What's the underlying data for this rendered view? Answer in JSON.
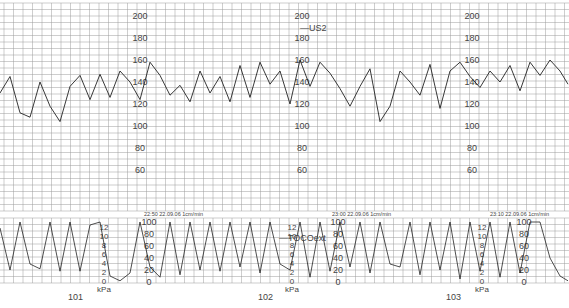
{
  "chart_data": {
    "type": "line",
    "panels": [
      {
        "name": "fetal_heart_rate",
        "channel_label": "US2",
        "ylabel": "bpm",
        "ylim": [
          50,
          210
        ],
        "yticks": [
          60,
          80,
          100,
          120,
          140,
          160,
          180,
          200
        ],
        "grid": true,
        "series": [
          {
            "name": "US2",
            "x": [
              0,
              10,
              20,
              30,
              40,
              50,
              60,
              70,
              80,
              90,
              100,
              110,
              120,
              130,
              140,
              150,
              160,
              170,
              180,
              190,
              200,
              210,
              220,
              230,
              240,
              250,
              260,
              270,
              280,
              290,
              300,
              310,
              320,
              330,
              340,
              350,
              360,
              370,
              380,
              390,
              400,
              410,
              420,
              430,
              440,
              450,
              460,
              470,
              480,
              490,
              500,
              510,
              520,
              530,
              540,
              550,
              560,
              568
            ],
            "y": [
              130,
              145,
              112,
              108,
              140,
              118,
              104,
              136,
              146,
              124,
              147,
              126,
              150,
              140,
              124,
              158,
              146,
              128,
              137,
              122,
              150,
              130,
              145,
              122,
              155,
              126,
              158,
              138,
              150,
              120,
              160,
              136,
              158,
              148,
              134,
              118,
              136,
              152,
              104,
              118,
              150,
              140,
              128,
              156,
              116,
              150,
              158,
              145,
              135,
              150,
              140,
              155,
              132,
              158,
              146,
              160,
              150,
              138
            ]
          }
        ]
      },
      {
        "name": "uterine_activity",
        "channel_label": "TOCOext",
        "ylabel": "kPa / mmHg",
        "ylim": [
          0,
          100
        ],
        "yticks_kpa": [
          0,
          2,
          4,
          6,
          8,
          10,
          12
        ],
        "yticks_toco": [
          0,
          20,
          40,
          60,
          80,
          100
        ],
        "unit_label": "kPa",
        "grid": true,
        "series": [
          {
            "name": "TOCOext",
            "x": [
              0,
              10,
              20,
              30,
              40,
              50,
              60,
              70,
              80,
              90,
              100,
              110,
              120,
              130,
              140,
              150,
              160,
              170,
              180,
              190,
              200,
              210,
              220,
              230,
              240,
              250,
              260,
              270,
              280,
              290,
              300,
              310,
              320,
              330,
              340,
              350,
              360,
              370,
              380,
              390,
              400,
              410,
              420,
              430,
              440,
              450,
              460,
              470,
              480,
              490,
              500,
              510,
              520,
              530,
              540,
              550,
              560,
              568
            ],
            "y": [
              90,
              20,
              100,
              30,
              22,
              100,
              18,
              100,
              18,
              95,
              100,
              10,
              2,
              15,
              100,
              25,
              8,
              100,
              12,
              100,
              20,
              100,
              18,
              100,
              25,
              100,
              15,
              100,
              30,
              20,
              100,
              8,
              100,
              18,
              100,
              25,
              100,
              15,
              100,
              30,
              25,
              100,
              12,
              100,
              20,
              100,
              5,
              100,
              18,
              100,
              8,
              100,
              15,
              100,
              100,
              40,
              10,
              2
            ]
          }
        ]
      }
    ],
    "time_stamps": [
      "22:50 22.09.06 1cm/min",
      "23:00 22.09.06 1cm/min",
      "23:10 22.09.06 1cm/min"
    ],
    "page_numbers": [
      "101",
      "102",
      "103"
    ],
    "legend": [
      "US2",
      "TOCOext"
    ]
  },
  "labels": {
    "fhr_scale": [
      "200",
      "180",
      "160",
      "140",
      "120",
      "100",
      "80",
      "60"
    ],
    "kpa_scale": [
      "12",
      "10",
      "8",
      "6",
      "4",
      "2",
      "0"
    ],
    "toco_scale": [
      "100",
      "80",
      "60",
      "40",
      "20",
      "0"
    ],
    "kpa_unit": "kPa",
    "us2": "—US2",
    "toco": "—TOCOext",
    "ts1": "22:50 22.09.06 1cm/min",
    "ts2": "23:00 22.09.06 1cm/min",
    "ts3": "23:10 22.09.06 1cm/min",
    "page1": "101",
    "page2": "102",
    "page3": "103"
  },
  "colors": {
    "grid": "#9a9a9a",
    "trace": "#222222",
    "label": "#444444"
  }
}
